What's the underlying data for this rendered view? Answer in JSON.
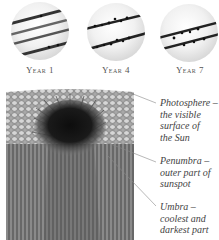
{
  "suns": [
    {
      "label": "Year 1",
      "description": "Sun with four widely spaced diagonal sunspot bands"
    },
    {
      "label": "Year 4",
      "description": "Sun with two dense sunspot bands"
    },
    {
      "label": "Year 7",
      "description": "Sun with two sunspot bands closer to the equator"
    }
  ],
  "annotations": [
    {
      "term": "Photosphere –",
      "lines": [
        "the visible",
        "surface of",
        "the Sun"
      ]
    },
    {
      "term": "Penumbra –",
      "lines": [
        "outer part of",
        "sunspot"
      ]
    },
    {
      "term": "Umbra –",
      "lines": [
        "coolest and",
        "darkest part"
      ]
    }
  ],
  "colors": {
    "band": "#2b2b2b",
    "umbra": "#111111",
    "photosphere": "#9a9a9a",
    "columns": "#6b6b6b"
  }
}
